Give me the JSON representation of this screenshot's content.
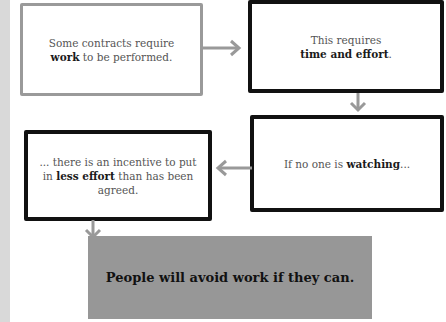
{
  "diagram": {
    "nodes": [
      {
        "id": "n1",
        "pre": "Some contracts require ",
        "bold": "work",
        "post": " to be performed.",
        "style": "gray-border"
      },
      {
        "id": "n2",
        "pre": "This requires ",
        "bold": "time and effort",
        "post": ".",
        "style": "black-border"
      },
      {
        "id": "n3",
        "pre": "If no one is ",
        "bold": "watching",
        "post": "...",
        "style": "black-border"
      },
      {
        "id": "n4",
        "pre": "... there is an incentive to put in ",
        "bold": "less effort",
        "post": " than has been agreed.",
        "style": "black-border"
      }
    ],
    "conclusion": "People will avoid work if they can.",
    "edges": [
      {
        "from": "n1",
        "to": "n2",
        "direction": "right"
      },
      {
        "from": "n2",
        "to": "n3",
        "direction": "down"
      },
      {
        "from": "n3",
        "to": "n4",
        "direction": "left"
      },
      {
        "from": "n4",
        "to": "conclusion",
        "direction": "down"
      }
    ],
    "colors": {
      "arrow": "#999999",
      "box1_border": "#9a9a9a",
      "box_border": "#111111",
      "conclusion_bg": "#979797",
      "left_strip": "#d9d9d9"
    }
  }
}
